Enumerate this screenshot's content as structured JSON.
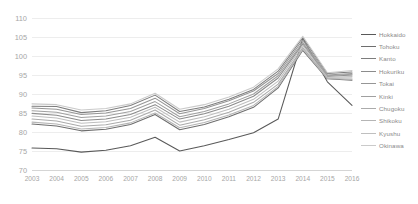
{
  "chart_data": {
    "type": "line",
    "title": "",
    "xlabel": "",
    "ylabel": "",
    "ylim": [
      70,
      110
    ],
    "ytick_step": 5,
    "yticks": [
      70,
      75,
      80,
      85,
      90,
      95,
      100,
      105,
      110
    ],
    "grid": true,
    "legend_position": "right",
    "categories": [
      "2003",
      "2004",
      "2005",
      "2006",
      "2007",
      "2008",
      "2009",
      "2010",
      "2011",
      "2012",
      "2013",
      "2014",
      "2015",
      "2016"
    ],
    "series": [
      {
        "name": "Hokkaido",
        "color": "#595959",
        "values": [
          75.8,
          75.6,
          74.7,
          75.2,
          76.4,
          78.6,
          75.0,
          76.4,
          78.0,
          79.8,
          83.4,
          104.6,
          93.2,
          87.0
        ]
      },
      {
        "name": "Tohoku",
        "color": "#6e6e6e",
        "values": [
          82.1,
          81.6,
          80.3,
          80.7,
          82.0,
          84.6,
          80.6,
          82.0,
          84.0,
          86.5,
          91.6,
          101.5,
          94.0,
          93.6
        ]
      },
      {
        "name": "Kanto",
        "color": "#7d7d7d",
        "values": [
          86.8,
          86.7,
          85.1,
          85.6,
          87.0,
          89.7,
          85.4,
          86.6,
          88.6,
          91.2,
          96.0,
          104.8,
          95.4,
          95.8
        ]
      },
      {
        "name": "Hokuriku",
        "color": "#8c8c8c",
        "values": [
          84.9,
          84.4,
          83.0,
          83.4,
          84.6,
          87.2,
          83.4,
          84.8,
          86.8,
          89.4,
          94.2,
          103.2,
          94.6,
          95.0
        ]
      },
      {
        "name": "Tokai",
        "color": "#969696",
        "values": [
          86.3,
          86.0,
          84.6,
          85.0,
          86.2,
          88.9,
          84.8,
          86.2,
          88.2,
          90.8,
          95.4,
          104.2,
          95.0,
          95.4
        ]
      },
      {
        "name": "Kinki",
        "color": "#a0a0a0",
        "values": [
          85.6,
          85.2,
          83.8,
          84.2,
          85.4,
          88.0,
          84.0,
          85.4,
          87.4,
          90.0,
          94.8,
          103.6,
          94.8,
          95.2
        ]
      },
      {
        "name": "Chugoku",
        "color": "#ababab",
        "values": [
          83.4,
          82.9,
          81.5,
          81.9,
          83.1,
          85.8,
          81.8,
          83.2,
          85.2,
          87.8,
          92.6,
          102.2,
          94.2,
          94.2
        ]
      },
      {
        "name": "Shikoku",
        "color": "#b5b5b5",
        "values": [
          82.6,
          82.1,
          80.8,
          81.2,
          82.4,
          85.0,
          81.1,
          82.5,
          84.5,
          87.0,
          92.0,
          101.8,
          94.1,
          93.8
        ]
      },
      {
        "name": "Kyushu",
        "color": "#bfbfbf",
        "values": [
          84.2,
          83.7,
          82.3,
          82.7,
          83.9,
          86.5,
          82.6,
          84.0,
          86.0,
          88.6,
          93.4,
          102.8,
          94.4,
          94.6
        ]
      },
      {
        "name": "Okinawa",
        "color": "#cacaca",
        "values": [
          87.4,
          87.2,
          85.8,
          86.2,
          87.4,
          90.2,
          86.0,
          87.2,
          89.2,
          91.8,
          96.6,
          105.2,
          95.6,
          96.2
        ]
      }
    ]
  }
}
